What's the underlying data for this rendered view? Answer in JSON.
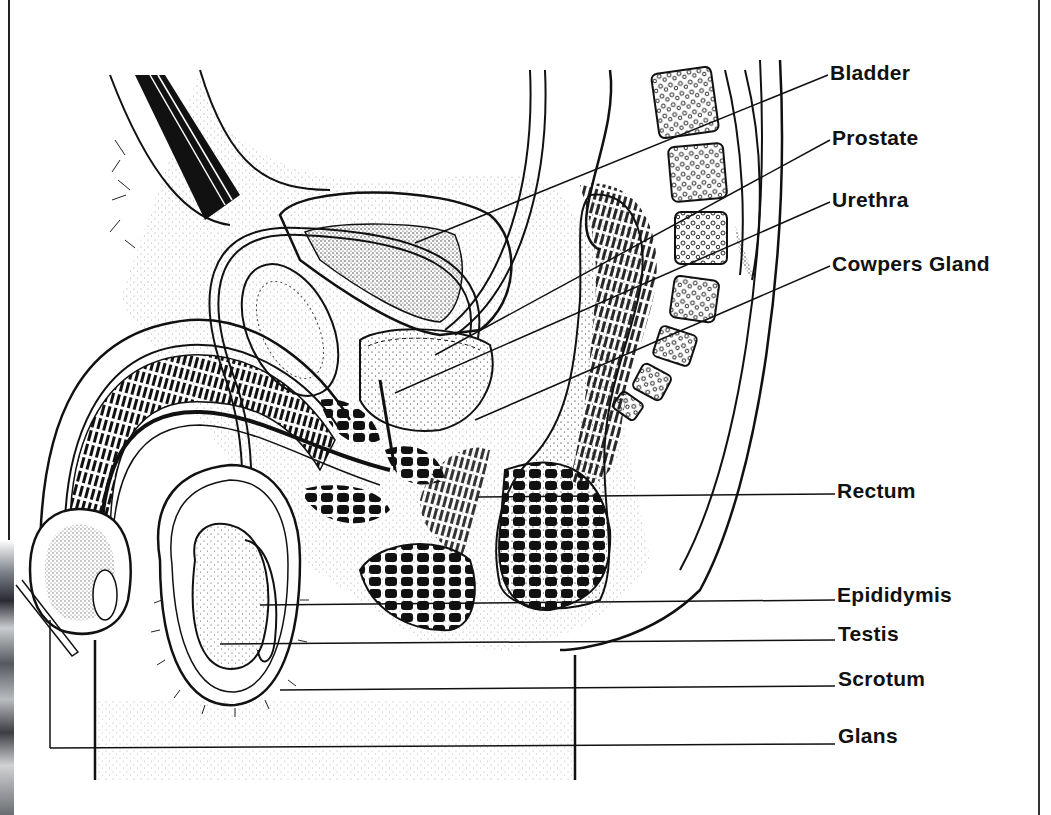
{
  "diagram": {
    "title": "",
    "labels": [
      {
        "id": "bladder",
        "text": "Bladder",
        "x": 830,
        "y": 62
      },
      {
        "id": "prostate",
        "text": "Prostate",
        "x": 832,
        "y": 127
      },
      {
        "id": "urethra",
        "text": "Urethra",
        "x": 832,
        "y": 189
      },
      {
        "id": "cowpers-gland",
        "text": "Cowpers Gland",
        "x": 832,
        "y": 253
      },
      {
        "id": "rectum",
        "text": "Rectum",
        "x": 837,
        "y": 480
      },
      {
        "id": "epididymis",
        "text": "Epididymis",
        "x": 837,
        "y": 584
      },
      {
        "id": "testis",
        "text": "Testis",
        "x": 838,
        "y": 623
      },
      {
        "id": "scrotum",
        "text": "Scrotum",
        "x": 838,
        "y": 668
      },
      {
        "id": "glans",
        "text": "Glans",
        "x": 838,
        "y": 725
      }
    ],
    "leader_lines": [
      {
        "label": "bladder",
        "from": [
          415,
          243
        ],
        "to": [
          828,
          75
        ]
      },
      {
        "label": "prostate",
        "from": [
          435,
          355
        ],
        "to": [
          830,
          140
        ]
      },
      {
        "label": "urethra",
        "from": [
          395,
          393
        ],
        "to": [
          830,
          202
        ]
      },
      {
        "label": "cowpers-gland",
        "from": [
          475,
          420
        ],
        "to": [
          830,
          266
        ]
      },
      {
        "label": "rectum",
        "from": [
          478,
          497
        ],
        "to": [
          835,
          494
        ]
      },
      {
        "label": "epididymis",
        "from": [
          260,
          605
        ],
        "to": [
          835,
          600
        ]
      },
      {
        "label": "testis",
        "from": [
          220,
          644
        ],
        "to": [
          835,
          640
        ]
      },
      {
        "label": "scrotum",
        "from": [
          280,
          690
        ],
        "to": [
          835,
          686
        ]
      },
      {
        "label": "glans",
        "from": [
          50,
          748
        ],
        "to": [
          835,
          744
        ]
      }
    ],
    "colors": {
      "ink": "#111111",
      "paper": "#ffffff",
      "stipple": "#555555"
    }
  }
}
